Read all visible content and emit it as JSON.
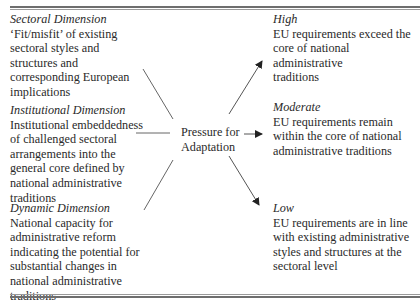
{
  "diagram": {
    "top_fragment": "'",
    "left": [
      {
        "title": "Sectoral Dimension",
        "body": "‘Fit/misfit’ of existing\nsectoral styles and\nstructures and\ncorresponding European\nimplications"
      },
      {
        "title": "Institutional Dimension",
        "body": "Institutional embeddedness\nof challenged sectoral\narrangements into the\ngeneral core defined by\nnational administrative\ntraditions"
      },
      {
        "title": "Dynamic Dimension",
        "body": "National capacity for\nadministrative reform\nindicating the potential for\nsubstantial changes in\nnational administrative\ntraditions"
      }
    ],
    "center": {
      "label": "Pressure for\nAdaptation"
    },
    "right": [
      {
        "title": "High",
        "body": "EU requirements exceed the\ncore of national administrative\ntraditions"
      },
      {
        "title": "Moderate",
        "body": "EU requirements remain\nwithin the core of national\nadministrative traditions"
      },
      {
        "title": "Low",
        "body": "EU requirements are in line\nwith existing administrative\nstyles and structures at the\nsectoral level"
      }
    ],
    "colors": {
      "text": "#2a2a2a",
      "line": "#555555",
      "rule": "#6e6e6e"
    }
  }
}
